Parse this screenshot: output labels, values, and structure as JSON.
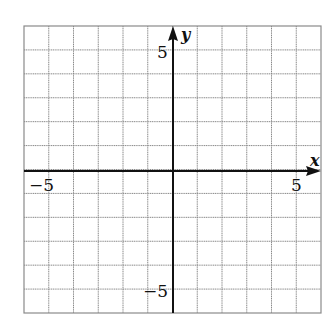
{
  "chart_data": {
    "type": "scatter",
    "title": "",
    "xlabel": "x",
    "ylabel": "y",
    "xlim": [
      -6,
      6
    ],
    "ylim": [
      -6,
      6
    ],
    "grid": true,
    "grid_step": 1,
    "x_tick_labels": [
      {
        "value": -5,
        "label": "−5"
      },
      {
        "value": 5,
        "label": "5"
      }
    ],
    "y_tick_labels": [
      {
        "value": 5,
        "label": "5"
      },
      {
        "value": -5,
        "label": "−5"
      }
    ],
    "series": [],
    "legend": null
  },
  "labels": {
    "x_axis": "x",
    "y_axis": "y",
    "x_neg5": "−5",
    "x_pos5": "5",
    "y_pos5": "5",
    "y_neg5": "−5"
  },
  "colors": {
    "grid": "#8a8a8a",
    "axis": "#111111",
    "background": "#ffffff"
  }
}
